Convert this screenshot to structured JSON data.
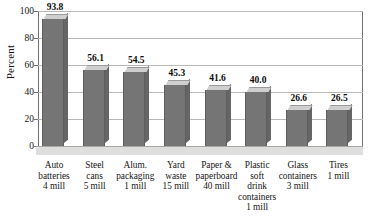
{
  "chart_data": {
    "type": "bar",
    "title": "",
    "xlabel": "",
    "ylabel": "Percent",
    "ylim": [
      0,
      100
    ],
    "yticks": [
      0,
      20,
      40,
      60,
      80,
      100
    ],
    "grid": true,
    "legend": false,
    "categories": [
      "Auto batteries 4 mill",
      "Steel cans 5 mill",
      "Alum. packaging 1 mill",
      "Yard waste 15 mill",
      "Paper & paperboard 40 mill",
      "Plastic soft drink containers 1 mill",
      "Glass containers 3 mill",
      "Tires 1 mill"
    ],
    "values": [
      93.8,
      56.1,
      54.5,
      45.3,
      41.6,
      40.0,
      26.6,
      26.5
    ],
    "value_labels": [
      "93.8",
      "56.1",
      "54.5",
      "45.3",
      "41.6",
      "40.0",
      "26.6",
      "26.5"
    ]
  },
  "axis": {
    "y_title": "Percent",
    "y_tick_labels": [
      "100",
      "80",
      "60",
      "40",
      "20",
      "0"
    ]
  },
  "categories": [
    {
      "lines": [
        "Auto",
        "batteries",
        "4 mill"
      ]
    },
    {
      "lines": [
        "Steel",
        "cans",
        "5 mill"
      ]
    },
    {
      "lines": [
        "Alum.",
        "packaging",
        "1 mill"
      ]
    },
    {
      "lines": [
        "Yard",
        "waste",
        "15 mill"
      ]
    },
    {
      "lines": [
        "Paper &",
        "paperboard",
        "40 mill"
      ]
    },
    {
      "lines": [
        "Plastic",
        "soft",
        "drink",
        "containers",
        "1 mill"
      ]
    },
    {
      "lines": [
        "Glass",
        "containers",
        "3 mill"
      ]
    },
    {
      "lines": [
        "Tires",
        "1 mill"
      ]
    }
  ],
  "colors": {
    "bar_front": "#757575",
    "bar_top": "#cfcfcf",
    "bar_side": "#656565",
    "gridline": "#b9b9b9",
    "floor": "#dededd",
    "text": "#111111"
  }
}
